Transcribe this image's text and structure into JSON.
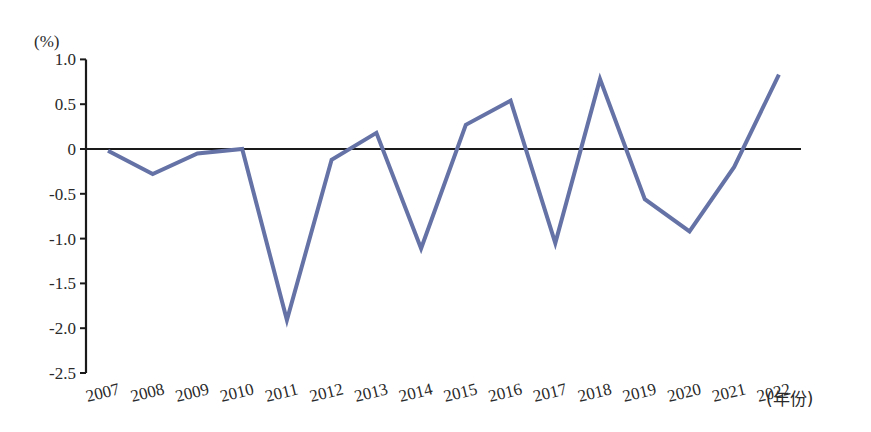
{
  "chart_data": {
    "type": "line",
    "title": "",
    "xlabel": "(年份)",
    "ylabel": "(%)",
    "ylim": [
      -2.5,
      1.0
    ],
    "yticks": [
      1.0,
      0.5,
      0,
      -0.5,
      -1.0,
      -1.5,
      -2.0,
      -2.5
    ],
    "ytick_labels": [
      "1.0",
      "0.5",
      "0",
      "-0.5",
      "-1.0",
      "-1.5",
      "-2.0",
      "-2.5"
    ],
    "grid": false,
    "legend": null,
    "reference_line": 0,
    "categories": [
      "2007",
      "2008",
      "2009",
      "2010",
      "2011",
      "2012",
      "2013",
      "2014",
      "2015",
      "2016",
      "2017",
      "2018",
      "2019",
      "2020",
      "2021",
      "2022"
    ],
    "series": [
      {
        "name": "value",
        "color": "#6472a6",
        "values": [
          -0.02,
          -0.28,
          -0.05,
          0.0,
          -1.91,
          -0.12,
          0.18,
          -1.11,
          0.27,
          0.54,
          -1.05,
          0.78,
          -0.56,
          -0.92,
          -0.2,
          0.83
        ]
      }
    ]
  },
  "labels": {
    "y_unit": "(%)",
    "x_unit": "(年份)"
  },
  "colors": {
    "line": "#6472a6",
    "axis": "#1a1a1a"
  }
}
